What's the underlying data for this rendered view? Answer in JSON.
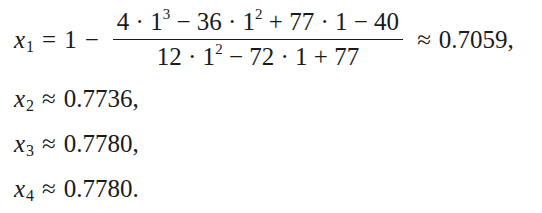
{
  "equations": {
    "line1": {
      "var": "x",
      "sub": "1",
      "lhs_eq": "=",
      "lead": "1",
      "minus": "−",
      "numerator": {
        "t1": "4 · 1",
        "e1": "3",
        "t2": " − 36 · 1",
        "e2": "2",
        "t3": " + 77 · 1 − 40"
      },
      "denominator": {
        "t1": "12 · 1",
        "e1": "2",
        "t2": " − 72 · 1 + 77"
      },
      "approx": "≈",
      "value": "0.7059,"
    },
    "line2": {
      "var": "x",
      "sub": "2",
      "approx": "≈",
      "value": "0.7736,"
    },
    "line3": {
      "var": "x",
      "sub": "3",
      "approx": "≈",
      "value": "0.7780,"
    },
    "line4": {
      "var": "x",
      "sub": "4",
      "approx": "≈",
      "value": "0.7780."
    }
  }
}
